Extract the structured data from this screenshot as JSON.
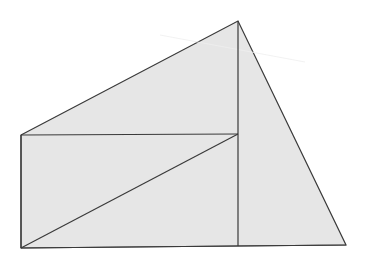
{
  "diagram": {
    "colors": {
      "fill": "#e6e6e6",
      "stroke": "#3a3a3a",
      "background": "#ffffff"
    },
    "labels": []
  }
}
